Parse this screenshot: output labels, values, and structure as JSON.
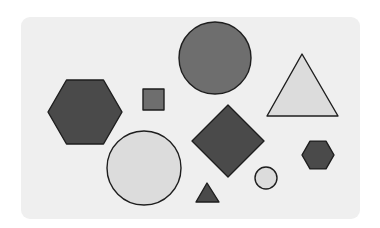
{
  "colors": {
    "background": "#ffffff",
    "card": "#efefef",
    "dark": "#4a4a4a",
    "medium": "#6e6e6e",
    "light": "#dcdcdc",
    "stroke": "#1e1e1e"
  },
  "shapes": [
    {
      "id": "large-hexagon",
      "type": "hexagon",
      "fill": "dark",
      "cx": 85,
      "cy": 112,
      "r": 37
    },
    {
      "id": "top-circle",
      "type": "circle",
      "fill": "medium",
      "cx": 215,
      "cy": 58,
      "r": 36
    },
    {
      "id": "right-triangle",
      "type": "triangle",
      "fill": "light",
      "points": [
        [
          302,
          54
        ],
        [
          338,
          116
        ],
        [
          267,
          116
        ]
      ]
    },
    {
      "id": "small-square",
      "type": "square",
      "fill": "medium",
      "x": 143,
      "y": 89,
      "size": 21
    },
    {
      "id": "diamond",
      "type": "diamond",
      "fill": "dark",
      "cx": 228,
      "cy": 141,
      "r": 36
    },
    {
      "id": "bottom-circle",
      "type": "circle",
      "fill": "light",
      "cx": 144,
      "cy": 168,
      "r": 37
    },
    {
      "id": "small-hexagon",
      "type": "hexagon",
      "fill": "dark",
      "cx": 318,
      "cy": 155,
      "r": 16
    },
    {
      "id": "small-circle",
      "type": "circle",
      "fill": "light",
      "cx": 266,
      "cy": 178,
      "r": 11
    },
    {
      "id": "small-triangle",
      "type": "triangle",
      "fill": "dark",
      "points": [
        [
          207,
          183
        ],
        [
          219,
          202
        ],
        [
          196,
          202
        ]
      ]
    }
  ]
}
